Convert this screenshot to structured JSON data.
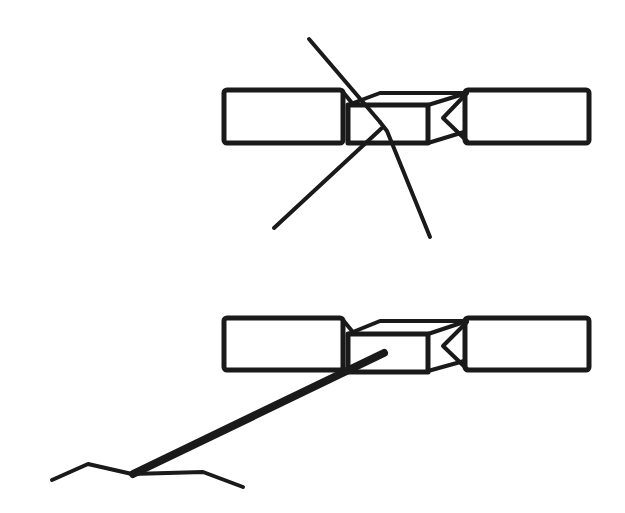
{
  "diagram": {
    "stroke_color": "#1a1a1a",
    "background_color": "#ffffff",
    "figures": [
      {
        "id": "top",
        "label": "satellite with crossed rods"
      },
      {
        "id": "bottom",
        "label": "satellite with rod to ground"
      }
    ]
  }
}
